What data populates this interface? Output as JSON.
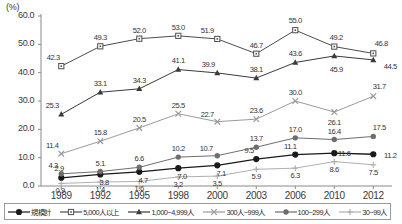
{
  "chart_data": {
    "type": "line",
    "title": "",
    "xlabel": "",
    "ylabel": "(%)",
    "unit_label": "(%)",
    "ylim": [
      0.0,
      60.0
    ],
    "ytick_labels": [
      "0.0",
      "10.0",
      "20.0",
      "30.0",
      "40.0",
      "50.0",
      "60.0"
    ],
    "ytick_values": [
      0.0,
      10.0,
      20.0,
      30.0,
      40.0,
      50.0,
      60.0
    ],
    "grid": false,
    "legend_position": "bottom",
    "categories": [
      "1989",
      "1992",
      "1995",
      "1998",
      "2000",
      "2003",
      "2006",
      "2010",
      "2012"
    ],
    "series": [
      {
        "name": "規模計",
        "marker": "filled-circle",
        "color": "#1a1a1a",
        "values": [
          2.9,
          4.1,
          5.0,
          6.3,
          7.3,
          9.5,
          11.1,
          11.6,
          11.2
        ],
        "labels": [
          "2.9",
          "",
          "",
          "",
          "",
          "9.5",
          "11.1",
          "11.6",
          "11.2"
        ]
      },
      {
        "name": "5,000人以上",
        "marker": "open-square",
        "color": "#4d4d4d",
        "values": [
          42.3,
          49.3,
          52.0,
          53.0,
          51.9,
          46.7,
          55.0,
          49.2,
          46.8
        ],
        "labels": [
          "42.3",
          "49.3",
          "52.0",
          "53.0",
          "51.9",
          "46.7",
          "55.0",
          "49.2",
          "46.8"
        ]
      },
      {
        "name": "1,000~4,999人",
        "marker": "filled-triangle",
        "color": "#3a3a3a",
        "values": [
          25.3,
          33.1,
          34.3,
          41.1,
          39.9,
          38.1,
          43.6,
          45.9,
          44.5
        ],
        "labels": [
          "25.3",
          "33.1",
          "34.3",
          "41.1",
          "39.9",
          "38.1",
          "43.6",
          "45.9",
          "44.5"
        ]
      },
      {
        "name": "300人~999人",
        "marker": "cross-x",
        "color": "#9a9a9a",
        "values": [
          11.4,
          15.8,
          20.5,
          25.5,
          22.7,
          23.6,
          30.0,
          26.1,
          31.7
        ],
        "labels": [
          "11.4",
          "15.8",
          "20.5",
          "25.5",
          "22.7",
          "23.6",
          "30.0",
          "26.1",
          "31.7"
        ]
      },
      {
        "name": "100~299人",
        "marker": "filled-circle-gray",
        "color": "#6e6e6e",
        "values": [
          4.3,
          5.1,
          6.6,
          10.2,
          10.7,
          13.7,
          17.0,
          16.4,
          17.5
        ],
        "labels": [
          "4.3",
          "5.1",
          "6.6",
          "10.2",
          "10.7",
          "13.7",
          "17.0",
          "16.4",
          "17.5"
        ]
      },
      {
        "name": "30~99人",
        "marker": "plus",
        "color": "#b0b0b0",
        "values": [
          0.9,
          1.4,
          1.6,
          3.2,
          3.5,
          5.9,
          6.3,
          8.6,
          7.5
        ],
        "labels": [
          "0.9",
          "1.4",
          "1.6",
          "3.2",
          "3.5",
          "5.9",
          "6.3",
          "8.6",
          "7.5"
        ]
      }
    ],
    "extra_labels": [
      {
        "text": "4.7",
        "series": "規模計",
        "category": "1995"
      },
      {
        "text": "7.0",
        "series": "規模計",
        "category": "1998"
      },
      {
        "text": "7.1",
        "series": "規模計",
        "category": "2000"
      },
      {
        "text": "3.8",
        "series": "規模計",
        "category": "1992"
      }
    ]
  },
  "legend": {
    "items": [
      {
        "label": "規模計",
        "marker": "filled-circle"
      },
      {
        "label": "5,000人以上",
        "marker": "open-square"
      },
      {
        "label": "1,000~4,999人",
        "marker": "filled-triangle"
      },
      {
        "label": "300人~999人",
        "marker": "cross-x"
      },
      {
        "label": "100~299人",
        "marker": "filled-circle-gray"
      },
      {
        "label": "30~99人",
        "marker": "plus"
      }
    ]
  }
}
